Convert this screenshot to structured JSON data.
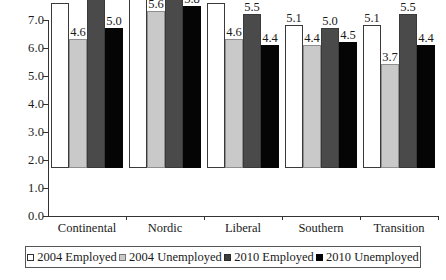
{
  "chart_data": {
    "type": "bar",
    "title": "",
    "xlabel": "",
    "ylabel": "",
    "ylim": [
      0.0,
      7.0
    ],
    "ytick_labels": [
      "0.0",
      "1.0",
      "2.0",
      "3.0",
      "4.0",
      "5.0",
      "6.0",
      "7.0"
    ],
    "ytick_values": [
      0.0,
      1.0,
      2.0,
      3.0,
      4.0,
      5.0,
      6.0,
      7.0
    ],
    "grid": false,
    "legend_position": "bottom",
    "categories": [
      "Continental",
      "Nordic",
      "Liberal",
      "Southern",
      "Transition"
    ],
    "series": [
      {
        "name": "2004 Employed",
        "color": "#ffffff",
        "values": [
          5.9,
          6.6,
          5.9,
          5.1,
          5.1
        ],
        "labels": [
          "5.9",
          "6.6",
          "5.9",
          "5.1",
          "5.1"
        ]
      },
      {
        "name": "2004 Unemployed",
        "color": "#c9c9c9",
        "values": [
          4.6,
          5.6,
          4.6,
          4.4,
          3.7
        ],
        "labels": [
          "4.6",
          "5.6",
          "4.6",
          "4.4",
          "3.7"
        ]
      },
      {
        "name": "2010 Employed",
        "color": "#4a4a4a",
        "values": [
          6.1,
          6.6,
          5.5,
          5.0,
          5.5
        ],
        "labels": [
          "6.1",
          "6.6",
          "5.5",
          "5.0",
          "5.5"
        ]
      },
      {
        "name": "2010 Unemployed",
        "color": "#050505",
        "values": [
          5.0,
          5.8,
          4.4,
          4.5,
          4.4
        ],
        "labels": [
          "5.0",
          "5.8",
          "4.4",
          "4.5",
          "4.4"
        ]
      }
    ]
  },
  "legend": {
    "items": [
      {
        "label": "2004 Employed"
      },
      {
        "label": "2004 Unemployed"
      },
      {
        "label": "2010 Employed"
      },
      {
        "label": "2010 Unemployed"
      }
    ]
  }
}
